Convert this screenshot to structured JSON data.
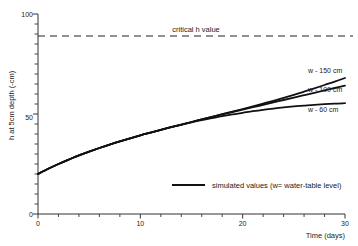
{
  "chart_data": {
    "type": "line",
    "title": "",
    "xlabel": "Time (days)",
    "ylabel": "h at 5cm depth (-cm)",
    "xlim": [
      0,
      30
    ],
    "ylim": [
      0,
      100
    ],
    "xticks": [
      0,
      10,
      20,
      30
    ],
    "xtick_labels": [
      "0",
      "10",
      "20",
      "30"
    ],
    "yticks": [
      0,
      50,
      100
    ],
    "ytick_labels": [
      "0",
      "50",
      "100"
    ],
    "y_minor_tick_step": 5,
    "grid": false,
    "legend_position": "inside-lower-center",
    "legend_entries": [
      {
        "label": "simulated values (w= water-table level)",
        "style": "solid"
      }
    ],
    "annotations": [
      {
        "name": "critical-h-value",
        "text": "critical h value",
        "y": 89,
        "style": "dashed"
      }
    ],
    "series": [
      {
        "name": "w - 150 cm",
        "label": "w - 150 cm",
        "style": "solid",
        "color": "#111111",
        "x": [
          0,
          1,
          2,
          3,
          4,
          5,
          6,
          7,
          8,
          9,
          10,
          11,
          12,
          13,
          14,
          15,
          16,
          17,
          18,
          19,
          20,
          21,
          22,
          23,
          24,
          25,
          26,
          27,
          28,
          29,
          30
        ],
        "y": [
          20.0,
          22.6,
          25.0,
          27.2,
          29.3,
          31.2,
          33.0,
          34.7,
          36.3,
          37.8,
          39.3,
          40.7,
          42.1,
          43.4,
          44.7,
          46.0,
          47.3,
          48.6,
          49.9,
          51.2,
          52.5,
          53.8,
          55.2,
          56.6,
          58.1,
          59.6,
          61.2,
          62.8,
          64.5,
          66.2,
          68.0
        ]
      },
      {
        "name": "w - 100 cm",
        "label": "w - 100 cm",
        "style": "solid",
        "color": "#111111",
        "x": [
          0,
          1,
          2,
          3,
          4,
          5,
          6,
          7,
          8,
          9,
          10,
          11,
          12,
          13,
          14,
          15,
          16,
          17,
          18,
          19,
          20,
          21,
          22,
          23,
          24,
          25,
          26,
          27,
          28,
          29,
          30
        ],
        "y": [
          20.0,
          22.6,
          25.0,
          27.2,
          29.3,
          31.2,
          33.0,
          34.7,
          36.3,
          37.8,
          39.3,
          40.7,
          42.1,
          43.4,
          44.7,
          46.0,
          47.3,
          48.6,
          49.8,
          51.0,
          52.2,
          53.4,
          54.6,
          55.8,
          57.0,
          58.2,
          59.4,
          60.6,
          61.8,
          63.0,
          64.2
        ]
      },
      {
        "name": "w - 60 cm",
        "label": "w - 60 cm",
        "style": "solid",
        "color": "#111111",
        "x": [
          0,
          1,
          2,
          3,
          4,
          5,
          6,
          7,
          8,
          9,
          10,
          11,
          12,
          13,
          14,
          15,
          16,
          17,
          18,
          19,
          20,
          21,
          22,
          23,
          24,
          25,
          26,
          27,
          28,
          29,
          30
        ],
        "y": [
          20.0,
          22.6,
          25.0,
          27.2,
          29.3,
          31.2,
          33.0,
          34.7,
          36.3,
          37.8,
          39.3,
          40.7,
          42.1,
          43.4,
          44.6,
          45.8,
          46.9,
          47.9,
          48.9,
          49.8,
          50.6,
          51.4,
          52.1,
          52.7,
          53.3,
          53.8,
          54.2,
          54.6,
          54.9,
          55.2,
          55.4
        ]
      }
    ]
  },
  "axis": {
    "y_title": "h at 5cm depth (-cm)",
    "x_title": "Time (days)",
    "y_top_label": "100",
    "y_mid_label": "50",
    "y_zero_label": "0",
    "x_labels": [
      "0",
      "10",
      "20",
      "30"
    ]
  },
  "annotations": {
    "critical": "critical h value"
  },
  "curve_labels": {
    "s150": "w - 150 cm",
    "s100": "w - 100 cm",
    "s60": "w - 60 cm"
  },
  "legend": {
    "text": "simulated values (w= water-table level)"
  },
  "colors": {
    "ink": "#111111",
    "axis": "#333333",
    "background": "#ffffff"
  }
}
